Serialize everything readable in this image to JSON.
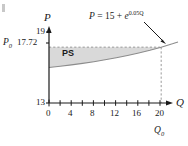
{
  "chart_data": {
    "type": "line",
    "title": "",
    "xlabel": "Q",
    "ylabel": "P",
    "equation_label": "P = 15 + e",
    "equation_exponent": "0.05Q",
    "xlim": [
      0,
      23
    ],
    "ylim": [
      13,
      19
    ],
    "x_ticks": [
      0,
      2,
      4,
      6,
      8,
      10,
      12,
      14,
      16,
      18,
      20,
      22
    ],
    "x_tick_labels": [
      "0",
      "",
      "4",
      "",
      "8",
      "",
      "12",
      "",
      "16",
      "",
      "20",
      ""
    ],
    "y_tick_labels": [
      "19",
      "17.72",
      "13"
    ],
    "grid": false,
    "legend": false,
    "annotations": [
      {
        "name": "ps-region",
        "text": "PS"
      },
      {
        "name": "equilibrium-price",
        "text": "P",
        "subscript": "0",
        "value": "17.72"
      },
      {
        "name": "equilibrium-quantity",
        "text": "Q",
        "subscript": "0",
        "value": "20"
      }
    ],
    "series": [
      {
        "name": "supply-curve",
        "equation": "P = 15 + e^(0.05Q)",
        "x": [
          0,
          2,
          4,
          6,
          8,
          10,
          12,
          14,
          16,
          18,
          20,
          22,
          23
        ],
        "y": [
          16.0,
          16.105,
          16.221,
          16.35,
          16.492,
          16.649,
          16.822,
          17.014,
          17.226,
          17.46,
          17.718,
          18.004,
          18.158
        ]
      }
    ],
    "shaded_region": {
      "name": "producer-surplus",
      "label": "PS",
      "top_value": 17.72,
      "x_from": 0,
      "x_to": 20,
      "fill_color": "#d9d9d9"
    },
    "dashed_lines": [
      {
        "name": "price-guide",
        "orientation": "horizontal",
        "value": 17.72
      },
      {
        "name": "quantity-guide",
        "orientation": "vertical",
        "value": 20
      }
    ],
    "colors": {
      "axis": "#1a1a1a",
      "curve": "#808080",
      "shade": "#d9d9d9",
      "dash": "#999999",
      "text": "#1a1a1a"
    }
  },
  "labels": {
    "y_axis_name": "P",
    "x_axis_name": "Q",
    "y_top": "19",
    "y_bottom": "13",
    "p0_symbol": "P",
    "p0_sub": "0",
    "p0_value": "17.72",
    "q0_symbol": "Q",
    "q0_sub": "0",
    "ps": "PS",
    "eq_lhs": "P",
    "eq_mid": " = 15 + ",
    "eq_base": "e",
    "eq_exp": "0.05Q",
    "x_0": "0",
    "x_4": "4",
    "x_8": "8",
    "x_12": "12",
    "x_16": "16",
    "x_20": "20"
  }
}
